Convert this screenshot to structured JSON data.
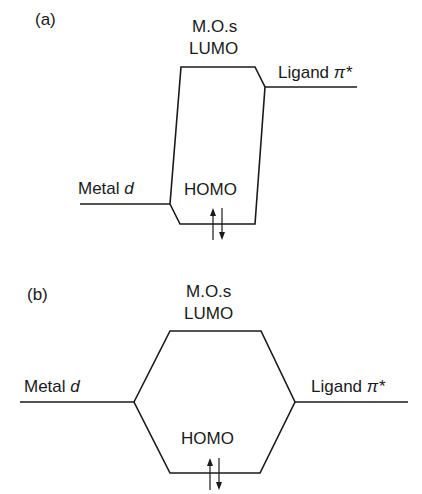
{
  "diagram": {
    "type": "molecular-orbital-energy-diagram",
    "panels": [
      {
        "id": "a",
        "label": "(a)",
        "mos_title": "M.O.s",
        "lumo_label": "LUMO",
        "homo_label": "HOMO",
        "left_level": {
          "text": "Metal ",
          "italic": "d"
        },
        "right_level": {
          "text": "Ligand ",
          "italic": "π*"
        },
        "electrons": "↑↓"
      },
      {
        "id": "b",
        "label": "(b)",
        "mos_title": "M.O.s",
        "lumo_label": "LUMO",
        "homo_label": "HOMO",
        "left_level": {
          "text": "Metal ",
          "italic": "d"
        },
        "right_level": {
          "text": "Ligand ",
          "italic": "π*"
        },
        "electrons": "↑↓"
      }
    ],
    "line_color": "#1a1a1a"
  }
}
